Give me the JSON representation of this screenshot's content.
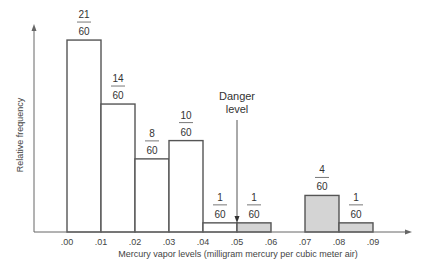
{
  "chart_data": {
    "type": "bar",
    "title": "",
    "xlabel": "Mercury vapor levels (milligram mercury per cubic meter air)",
    "ylabel": "Relative frequency",
    "tick_labels": [
      ".00",
      ".01",
      ".02",
      ".03",
      ".04",
      ".05",
      ".06",
      ".07",
      ".08",
      ".09"
    ],
    "bins": [
      {
        "from": 0.0,
        "to": 0.01,
        "count": 21,
        "total": 60,
        "shaded": false
      },
      {
        "from": 0.01,
        "to": 0.02,
        "count": 14,
        "total": 60,
        "shaded": false
      },
      {
        "from": 0.02,
        "to": 0.03,
        "count": 8,
        "total": 60,
        "shaded": false
      },
      {
        "from": 0.03,
        "to": 0.04,
        "count": 10,
        "total": 60,
        "shaded": false
      },
      {
        "from": 0.04,
        "to": 0.05,
        "count": 1,
        "total": 60,
        "shaded": false
      },
      {
        "from": 0.05,
        "to": 0.06,
        "count": 1,
        "total": 60,
        "shaded": true
      },
      {
        "from": 0.06,
        "to": 0.07,
        "count": 0,
        "total": 60,
        "shaded": true
      },
      {
        "from": 0.07,
        "to": 0.08,
        "count": 4,
        "total": 60,
        "shaded": true
      },
      {
        "from": 0.08,
        "to": 0.09,
        "count": 1,
        "total": 60,
        "shaded": true
      }
    ],
    "categories": [
      ".00-.01",
      ".01-.02",
      ".02-.03",
      ".03-.04",
      ".04-.05",
      ".05-.06",
      ".06-.07",
      ".07-.08",
      ".08-.09"
    ],
    "values": [
      0.35,
      0.2333,
      0.1333,
      0.1667,
      0.0167,
      0.0167,
      0,
      0.0667,
      0.0167
    ],
    "annotations": [
      {
        "text": "Danger level",
        "x": 0.05
      }
    ],
    "grid": false,
    "legend": null
  },
  "colors": {
    "shaded": "#d4d4d4",
    "outline": "#555555",
    "axis": "#666666"
  }
}
